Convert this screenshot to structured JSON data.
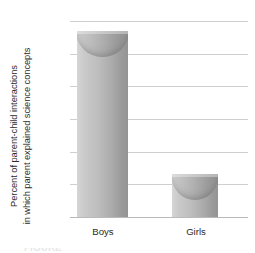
{
  "chart_data": {
    "type": "bar",
    "title": "",
    "subtitle": "",
    "categories": [
      "Boys",
      "Girls"
    ],
    "values": [
      28.3,
      6.4
    ],
    "xlabel": "",
    "ylabel_line1": "Percent of parent-child interactions",
    "ylabel_line2": "in which parent explained science concepts",
    "ylim": [
      0,
      30
    ],
    "ytick_values": [
      0,
      5,
      10,
      15,
      20,
      25,
      30
    ],
    "ytick_labels": [
      "0",
      "5",
      "10",
      "15",
      "20",
      "25",
      "30"
    ],
    "ytick_step": 5,
    "grid": "horizontal",
    "legend": "none",
    "series": [
      {
        "name": "Percent of parent-child interactions in which parent explained science concepts",
        "values": [
          28.3,
          6.4
        ]
      }
    ],
    "bar_style": "3d-cylinder-gradient",
    "colors": {
      "bar_light": "#d5d5d5",
      "bar_dark": "#949494",
      "gridline": "#cfcfcf",
      "baseline": "#b9b9b9",
      "text": "#2b2b2b",
      "background": "#ffffff"
    }
  },
  "caption_sliver": "FIGURE"
}
